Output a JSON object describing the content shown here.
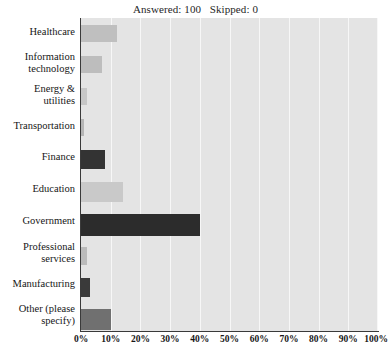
{
  "chart_data": {
    "type": "bar",
    "orientation": "horizontal",
    "title": "Answered: 100   Skipped: 0",
    "xlabel": "",
    "ylabel": "",
    "xlim": [
      0,
      100
    ],
    "grid": true,
    "legend": false,
    "categories": [
      "Healthcare",
      "Information technology",
      "Energy & utilities",
      "Transportation",
      "Finance",
      "Education",
      "Government",
      "Professional services",
      "Manufacturing",
      "Other (please specify)"
    ],
    "values": [
      12,
      7,
      2,
      1,
      8,
      14,
      40,
      2,
      3,
      10
    ],
    "tick_labels": [
      "0%",
      "10%",
      "20%",
      "30%",
      "40%",
      "50%",
      "60%",
      "70%",
      "80%",
      "90%",
      "100%"
    ],
    "tick_values": [
      0,
      10,
      20,
      30,
      40,
      50,
      60,
      70,
      80,
      90,
      100
    ],
    "bar_colors": [
      "#bfbfbf",
      "#bdbdbd",
      "#c7c7c7",
      "#b6b6b6",
      "#333333",
      "#c9c9c9",
      "#2c2c2c",
      "#bbbbbb",
      "#3a3a3a",
      "#707070"
    ],
    "plot_background": "#e4e4e4",
    "gridline_color": "#f7f7f7",
    "axis_color": "#3a3a3a"
  },
  "labels": {
    "healthcare": "Healthcare",
    "information_technology_line1": "Information",
    "information_technology_line2": "technology",
    "energy_utilities_line1": "Energy &",
    "energy_utilities_line2": "utilities",
    "transportation": "Transportation",
    "finance": "Finance",
    "education": "Education",
    "government": "Government",
    "professional_services_line1": "Professional",
    "professional_services_line2": "services",
    "manufacturing": "Manufacturing",
    "other_line1": "Other (please",
    "other_line2": "specify)"
  },
  "ticks": {
    "t0": "0%",
    "t1": "10%",
    "t2": "20%",
    "t3": "30%",
    "t4": "40%",
    "t5": "50%",
    "t6": "60%",
    "t7": "70%",
    "t8": "80%",
    "t9": "90%",
    "t10": "100%"
  },
  "header": {
    "summary": "Answered: 100   Skipped: 0"
  }
}
